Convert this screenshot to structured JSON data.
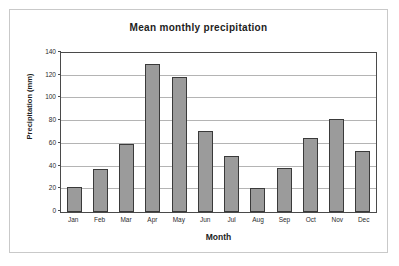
{
  "chart_data": {
    "type": "bar",
    "title": "Mean monthly precipitation",
    "xlabel": "Month",
    "ylabel": "Precipitation (mm)",
    "categories": [
      "Jan",
      "Feb",
      "Mar",
      "Apr",
      "May",
      "Jun",
      "Jul",
      "Aug",
      "Sep",
      "Oct",
      "Nov",
      "Dec"
    ],
    "values": [
      22,
      38,
      60,
      130,
      119,
      71,
      49,
      21,
      39,
      65,
      82,
      54
    ],
    "ylim": [
      0,
      140
    ],
    "yticks": [
      0,
      20,
      40,
      60,
      80,
      100,
      120,
      140
    ],
    "ytick_labels": [
      "0",
      "20",
      "40",
      "60",
      "80",
      "100",
      "120",
      "140"
    ],
    "grid": true,
    "legend": false,
    "bar_color": "#9b9b9b",
    "bar_border_color": "#3a3a3a",
    "gridline_color": "#b4b4b4",
    "axis_color": "#4a4a4a",
    "plot_background": "#ffffff"
  }
}
